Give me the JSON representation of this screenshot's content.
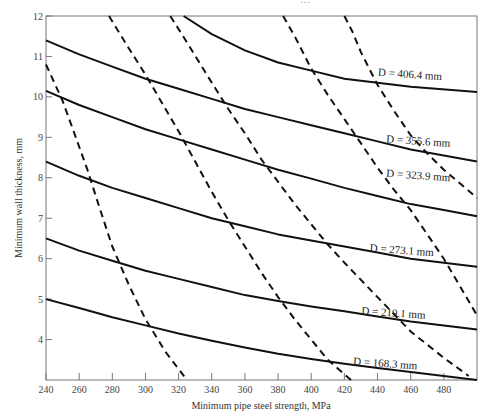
{
  "header_fragment": "…",
  "chart_data": {
    "type": "line",
    "title": "",
    "xlabel": "Minimum pipe steel strength, MPa",
    "ylabel": "Minimum wall thickness, mm",
    "xlim": [
      240,
      500
    ],
    "ylim": [
      3,
      12
    ],
    "x_ticks": [
      240,
      260,
      280,
      300,
      320,
      340,
      360,
      380,
      400,
      420,
      440,
      460,
      480
    ],
    "y_ticks": [
      4,
      5,
      6,
      7,
      8,
      9,
      10,
      11,
      12
    ],
    "grid": false,
    "legend": "inline labels",
    "series": [
      {
        "name": "D = 406.4 mm",
        "style": "solid",
        "label_pos": [
          440,
          10.45
        ],
        "points": [
          [
            323,
            12.0
          ],
          [
            340,
            11.55
          ],
          [
            360,
            11.15
          ],
          [
            380,
            10.85
          ],
          [
            400,
            10.65
          ],
          [
            420,
            10.45
          ],
          [
            440,
            10.35
          ],
          [
            460,
            10.25
          ],
          [
            500,
            10.12
          ]
        ]
      },
      {
        "name": "D = 355.6 mm",
        "style": "solid",
        "label_pos": [
          445,
          8.8
        ],
        "points": [
          [
            240,
            11.4
          ],
          [
            260,
            11.05
          ],
          [
            280,
            10.75
          ],
          [
            300,
            10.45
          ],
          [
            320,
            10.2
          ],
          [
            340,
            9.95
          ],
          [
            360,
            9.7
          ],
          [
            380,
            9.5
          ],
          [
            400,
            9.3
          ],
          [
            420,
            9.1
          ],
          [
            440,
            8.9
          ],
          [
            460,
            8.7
          ],
          [
            480,
            8.55
          ],
          [
            500,
            8.4
          ]
        ]
      },
      {
        "name": "D = 323.9 mm",
        "style": "solid",
        "label_pos": [
          445,
          7.95
        ],
        "points": [
          [
            240,
            10.15
          ],
          [
            260,
            9.8
          ],
          [
            280,
            9.5
          ],
          [
            300,
            9.2
          ],
          [
            320,
            8.95
          ],
          [
            340,
            8.7
          ],
          [
            360,
            8.45
          ],
          [
            380,
            8.2
          ],
          [
            400,
            7.98
          ],
          [
            420,
            7.75
          ],
          [
            440,
            7.55
          ],
          [
            460,
            7.35
          ],
          [
            480,
            7.2
          ],
          [
            500,
            7.05
          ]
        ]
      },
      {
        "name": "D = 273.1 mm",
        "style": "solid",
        "label_pos": [
          435,
          6.1
        ],
        "points": [
          [
            240,
            8.4
          ],
          [
            260,
            8.05
          ],
          [
            280,
            7.75
          ],
          [
            300,
            7.5
          ],
          [
            320,
            7.25
          ],
          [
            340,
            7.0
          ],
          [
            360,
            6.8
          ],
          [
            380,
            6.6
          ],
          [
            400,
            6.45
          ],
          [
            420,
            6.3
          ],
          [
            440,
            6.15
          ],
          [
            460,
            6.0
          ],
          [
            480,
            5.9
          ],
          [
            500,
            5.8
          ]
        ]
      },
      {
        "name": "D = 219.1 mm",
        "style": "solid",
        "label_pos": [
          430,
          4.55
        ],
        "points": [
          [
            240,
            6.5
          ],
          [
            260,
            6.2
          ],
          [
            280,
            5.95
          ],
          [
            300,
            5.7
          ],
          [
            320,
            5.5
          ],
          [
            340,
            5.3
          ],
          [
            360,
            5.1
          ],
          [
            380,
            4.95
          ],
          [
            400,
            4.82
          ],
          [
            420,
            4.7
          ],
          [
            440,
            4.57
          ],
          [
            460,
            4.45
          ],
          [
            480,
            4.35
          ],
          [
            500,
            4.25
          ]
        ]
      },
      {
        "name": "D = 168.3 mm",
        "style": "solid",
        "label_pos": [
          425,
          3.3
        ],
        "points": [
          [
            240,
            5.0
          ],
          [
            260,
            4.78
          ],
          [
            280,
            4.55
          ],
          [
            300,
            4.35
          ],
          [
            320,
            4.15
          ],
          [
            340,
            3.97
          ],
          [
            360,
            3.8
          ],
          [
            380,
            3.65
          ],
          [
            400,
            3.52
          ],
          [
            420,
            3.4
          ],
          [
            440,
            3.3
          ],
          [
            460,
            3.2
          ],
          [
            480,
            3.1
          ],
          [
            500,
            3.0
          ]
        ]
      },
      {
        "name": "dashed-1",
        "style": "dashed",
        "points": [
          [
            240,
            10.8
          ],
          [
            245,
            10.35
          ],
          [
            250,
            9.9
          ],
          [
            258,
            9.0
          ],
          [
            265,
            8.2
          ],
          [
            272,
            7.3
          ],
          [
            280,
            6.3
          ],
          [
            290,
            5.35
          ],
          [
            300,
            4.5
          ],
          [
            312,
            3.7
          ],
          [
            325,
            3.0
          ]
        ]
      },
      {
        "name": "dashed-2",
        "style": "dashed",
        "points": [
          [
            278,
            12.0
          ],
          [
            290,
            11.2
          ],
          [
            300,
            10.55
          ],
          [
            310,
            9.85
          ],
          [
            320,
            9.15
          ],
          [
            330,
            8.4
          ],
          [
            340,
            7.65
          ],
          [
            350,
            6.95
          ],
          [
            360,
            6.3
          ],
          [
            370,
            5.65
          ],
          [
            380,
            5.05
          ],
          [
            390,
            4.5
          ],
          [
            400,
            4.0
          ],
          [
            410,
            3.5
          ],
          [
            424,
            3.0
          ]
        ]
      },
      {
        "name": "dashed-3",
        "style": "dashed",
        "points": [
          [
            315,
            12.0
          ],
          [
            325,
            11.35
          ],
          [
            340,
            10.35
          ],
          [
            350,
            9.7
          ],
          [
            360,
            9.1
          ],
          [
            370,
            8.45
          ],
          [
            380,
            7.9
          ],
          [
            390,
            7.35
          ],
          [
            400,
            6.85
          ],
          [
            410,
            6.35
          ],
          [
            420,
            5.9
          ],
          [
            440,
            5.05
          ],
          [
            460,
            4.2
          ],
          [
            480,
            3.55
          ],
          [
            495,
            3.1
          ]
        ]
      },
      {
        "name": "dashed-4",
        "style": "dashed",
        "points": [
          [
            383,
            12.0
          ],
          [
            390,
            11.5
          ],
          [
            400,
            10.7
          ],
          [
            410,
            10.05
          ],
          [
            420,
            9.45
          ],
          [
            430,
            8.85
          ],
          [
            440,
            8.25
          ],
          [
            450,
            7.7
          ],
          [
            460,
            7.2
          ],
          [
            470,
            6.6
          ],
          [
            480,
            6.0
          ],
          [
            490,
            5.3
          ],
          [
            500,
            4.6
          ]
        ]
      },
      {
        "name": "dashed-5",
        "style": "dashed",
        "points": [
          [
            420,
            12.0
          ],
          [
            425,
            11.6
          ],
          [
            430,
            11.1
          ],
          [
            440,
            10.3
          ],
          [
            450,
            9.65
          ],
          [
            460,
            9.05
          ],
          [
            470,
            8.6
          ],
          [
            480,
            8.2
          ],
          [
            490,
            7.85
          ],
          [
            500,
            7.5
          ]
        ]
      }
    ]
  }
}
